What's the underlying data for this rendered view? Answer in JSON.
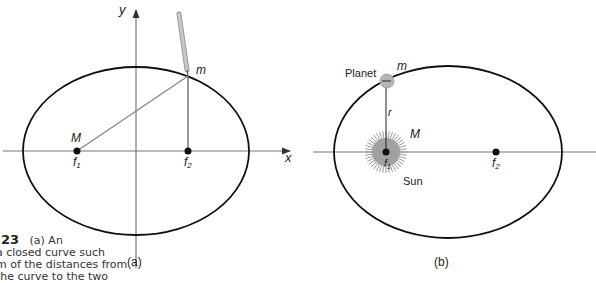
{
  "panel_a": {
    "label": "(a)",
    "axis_y": "y",
    "axis_x": "x",
    "mass_big": "M",
    "mass_small": "m",
    "focus1": "f",
    "focus1_sub": "1",
    "focus2": "f",
    "focus2_sub": "2"
  },
  "panel_b": {
    "label": "(b)",
    "planet_label": "Planet",
    "planet_mass": "m",
    "radius_label": "r",
    "sun_mass": "M",
    "sun_label": "Sun",
    "focus1": "f",
    "focus1_sub": "1",
    "focus2": "f",
    "focus2_sub": "2"
  },
  "caption": {
    "number": ".23",
    "line1": "(a) An",
    "line2": "a closed curve such",
    "line3": "m of the distances from",
    "line4": "the curve to the two"
  },
  "colors": {
    "curve": "#111111",
    "axis": "#777777",
    "sun_fill": "#a0a0a0",
    "planet_fill": "#b5b5b5",
    "pencil": "#b0b0b0"
  }
}
